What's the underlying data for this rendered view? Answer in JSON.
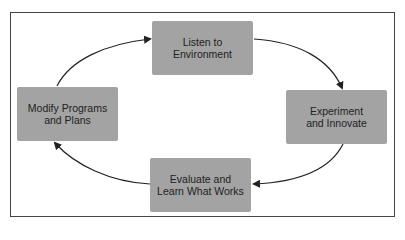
{
  "diagram": {
    "type": "cycle",
    "nodes": [
      {
        "id": "listen",
        "lines": [
          "Listen to",
          "Environment"
        ]
      },
      {
        "id": "experiment",
        "lines": [
          "Experiment",
          "and Innovate"
        ]
      },
      {
        "id": "evaluate",
        "lines": [
          "Evaluate and",
          "Learn What Works"
        ]
      },
      {
        "id": "modify",
        "lines": [
          "Modify Programs",
          "and Plans"
        ]
      }
    ],
    "edges": [
      {
        "from": "listen",
        "to": "experiment"
      },
      {
        "from": "experiment",
        "to": "evaluate"
      },
      {
        "from": "evaluate",
        "to": "modify"
      },
      {
        "from": "modify",
        "to": "listen"
      }
    ],
    "colors": {
      "box_fill": "#a3a3a3",
      "stroke": "#222222",
      "frame": "#444444"
    }
  }
}
